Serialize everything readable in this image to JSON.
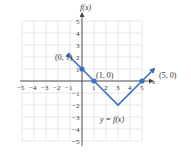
{
  "chart_data": {
    "type": "line",
    "title": "",
    "xlabel": "x",
    "ylabel": "f(x)",
    "xlim": [
      -5,
      5
    ],
    "ylim": [
      -5,
      5
    ],
    "grid": true,
    "x_ticks": [
      "-5",
      "-4",
      "-3",
      "-2",
      "-1",
      "1",
      "2",
      "3",
      "4",
      "5"
    ],
    "y_ticks": [
      "5",
      "4",
      "3",
      "2",
      "1",
      "-1",
      "-2",
      "-3",
      "-4",
      "-5"
    ],
    "series": [
      {
        "name": "y = f(x)",
        "x": [
          -1,
          0,
          1,
          3,
          5,
          6
        ],
        "y": [
          2,
          1,
          0,
          -2,
          0,
          1
        ],
        "arrows_at_ends": true,
        "color": "#3a6fc4"
      }
    ],
    "highlighted_points": [
      {
        "label": "(0, 1)",
        "x": 0,
        "y": 1
      },
      {
        "label": "(1, 0)",
        "x": 1,
        "y": 0
      },
      {
        "label": "(5, 0)",
        "x": 5,
        "y": 0
      }
    ],
    "annotation": "y = f(x)"
  },
  "labels": {
    "y_axis": "f(x)",
    "x_axis": "x",
    "point_0_1": "(0, 1)",
    "point_1_0": "(1, 0)",
    "point_5_0": "(5, 0)",
    "function_label": "y = f(x)"
  },
  "colors": {
    "line": "#3a6fc4",
    "grid": "#e2e2e2",
    "axis": "#444444"
  }
}
